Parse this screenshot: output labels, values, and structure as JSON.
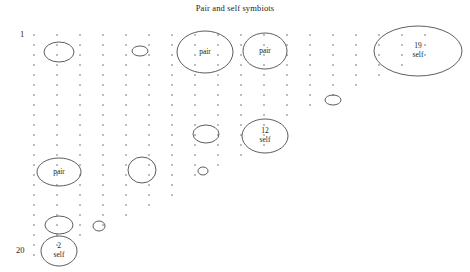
{
  "chart_data": {
    "type": "scatter",
    "title": "Pair and self symbiots",
    "xlabel": "",
    "ylabel": "",
    "grid": true,
    "legend": "none",
    "axis_ticks": {
      "left_top_label": "1",
      "left_bottom_label": "20"
    },
    "grid_dots": {
      "description": "staircase triangular field of small dots",
      "col_x": [
        34,
        57,
        80,
        103,
        126,
        149,
        172,
        195,
        218,
        241,
        264,
        287,
        310,
        333,
        356,
        379,
        402,
        425
      ],
      "row_y_start": 35,
      "row_spacing": 10,
      "col_row_counts": [
        23,
        22,
        21,
        20,
        19,
        18,
        17,
        15,
        14,
        13,
        12,
        9,
        8,
        7,
        6,
        5,
        4,
        3
      ]
    },
    "ellipses": [
      {
        "cx": 59,
        "cy": 52,
        "rx": 15,
        "ry": 10,
        "label": ""
      },
      {
        "cx": 140,
        "cy": 51,
        "rx": 8,
        "ry": 5,
        "label": ""
      },
      {
        "cx": 205,
        "cy": 52,
        "rx": 28,
        "ry": 21,
        "label": "pair"
      },
      {
        "cx": 265,
        "cy": 51,
        "rx": 22,
        "ry": 18,
        "label": "pair"
      },
      {
        "cx": 418,
        "cy": 51,
        "rx": 44,
        "ry": 25,
        "label": "19\nself"
      },
      {
        "cx": 333,
        "cy": 100,
        "rx": 8,
        "ry": 5,
        "label": ""
      },
      {
        "cx": 206,
        "cy": 134,
        "rx": 13,
        "ry": 9,
        "label": ""
      },
      {
        "cx": 265,
        "cy": 136,
        "rx": 23,
        "ry": 17,
        "label": "12\nself"
      },
      {
        "cx": 59,
        "cy": 172,
        "rx": 22,
        "ry": 14,
        "label": "pair"
      },
      {
        "cx": 142,
        "cy": 170,
        "rx": 14,
        "ry": 13,
        "label": ""
      },
      {
        "cx": 203,
        "cy": 171,
        "rx": 5,
        "ry": 4,
        "label": ""
      },
      {
        "cx": 59,
        "cy": 225,
        "rx": 14,
        "ry": 9,
        "label": ""
      },
      {
        "cx": 99,
        "cy": 226,
        "rx": 6,
        "ry": 5,
        "label": ""
      },
      {
        "cx": 59,
        "cy": 251,
        "rx": 18,
        "ry": 15,
        "label": "2\nself"
      }
    ],
    "colors": {
      "background": "#ffffff",
      "stroke": "#333333",
      "dot": "#4a4a4a",
      "text": "#222222"
    }
  }
}
